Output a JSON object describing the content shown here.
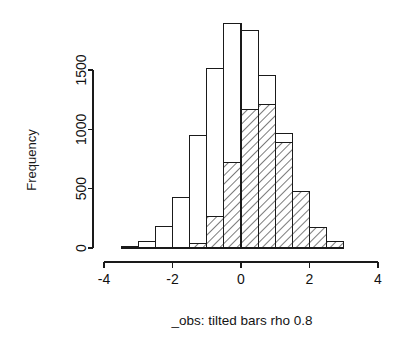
{
  "chart_data": {
    "type": "bar",
    "subtype": "histogram-overlay",
    "title": "",
    "subtitle": "",
    "xlabel": "_obs: tilted bars  rho 0.8",
    "ylabel": "Frequency",
    "xlim": [
      -4,
      4
    ],
    "ylim": [
      0,
      1900
    ],
    "grid": false,
    "legend": "none",
    "bin_width": 0.5,
    "bin_edges": [
      -3.5,
      -3.0,
      -2.5,
      -2.0,
      -1.5,
      -1.0,
      -0.5,
      0.0,
      0.5,
      1.0,
      1.5,
      2.0,
      2.5,
      3.0
    ],
    "bin_centers": [
      -3.25,
      -2.75,
      -2.25,
      -1.75,
      -1.25,
      -0.75,
      -0.25,
      0.25,
      0.75,
      1.25,
      1.75,
      2.25,
      2.75
    ],
    "x_ticks": [
      -4,
      -2,
      0,
      2,
      4
    ],
    "x_tick_labels": [
      "-4",
      "-2",
      "0",
      "2",
      "4"
    ],
    "y_ticks": [
      0,
      500,
      1000,
      1500
    ],
    "y_tick_labels": [
      "0",
      "500",
      "1000",
      "1500"
    ],
    "series": [
      {
        "name": "open bars",
        "style": "open",
        "fill": "#ffffff",
        "stroke": "#1a1a1a",
        "values": [
          15,
          55,
          185,
          425,
          945,
          1515,
          1890,
          1830,
          1450,
          965,
          470,
          175,
          45
        ]
      },
      {
        "name": "tilted bars",
        "style": "hatched",
        "fill": "none",
        "hatch_angle": 45,
        "stroke": "#1a1a1a",
        "values": [
          0,
          0,
          0,
          0,
          35,
          265,
          720,
          1165,
          1210,
          890,
          475,
          175,
          55
        ]
      }
    ]
  },
  "axes": {
    "y_axis_title": "Frequency",
    "x_axis_title": "_obs: tilted bars  rho 0.8"
  },
  "ticks": {
    "y": [
      "0",
      "500",
      "1000",
      "1500"
    ],
    "x": [
      "-4",
      "-2",
      "0",
      "2",
      "4"
    ]
  }
}
